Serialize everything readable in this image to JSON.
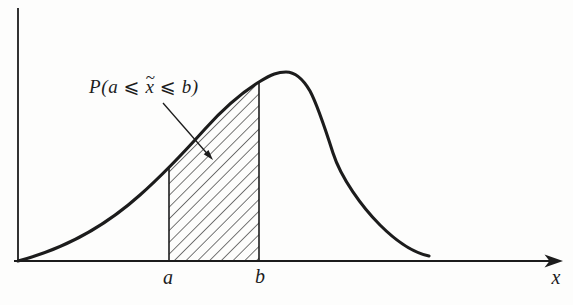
{
  "labels": {
    "probability": {
      "prefix": "P(a ⩽ ",
      "tilde": "~",
      "variable": "x",
      "suffix": " ⩽ b)"
    },
    "interval_start": "a",
    "interval_end": "b",
    "x_axis": "x"
  },
  "colors": {
    "ink": "#1c1c1c",
    "background": "#fdfdfc"
  }
}
